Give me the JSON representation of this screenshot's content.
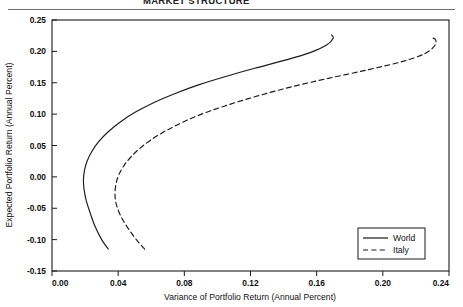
{
  "page": {
    "running_head": "MARKET STRUCTURE"
  },
  "chart_data": {
    "type": "line",
    "title": "",
    "xlabel": "Variance of Portfolio Return (Annual Percent)",
    "ylabel": "Expected Portfolio Return (Annual Percent)",
    "xlim": [
      0.0,
      0.24
    ],
    "ylim": [
      -0.15,
      0.25
    ],
    "xticks": [
      "0.00",
      "0.04",
      "0.08",
      "0.12",
      "0.16",
      "0.20",
      "0.24"
    ],
    "xtick_values": [
      0.0,
      0.04,
      0.08,
      0.12,
      0.16,
      0.2,
      0.24
    ],
    "yticks": [
      "0.25",
      "0.20",
      "0.15",
      "0.10",
      "0.05",
      "0.00",
      "-0.05",
      "-0.10",
      "-0.15"
    ],
    "ytick_values": [
      0.25,
      0.2,
      0.15,
      0.1,
      0.05,
      0.0,
      -0.05,
      -0.1,
      -0.15
    ],
    "grid": false,
    "legend_position": "bottom-right",
    "series": [
      {
        "name": "World",
        "style": "solid",
        "color": "#1a1a1a",
        "points": [
          [
            0.034,
            -0.115
          ],
          [
            0.03,
            -0.1
          ],
          [
            0.0262,
            -0.08
          ],
          [
            0.0234,
            -0.06
          ],
          [
            0.0207,
            -0.038
          ],
          [
            0.0194,
            -0.02
          ],
          [
            0.019,
            -0.005
          ],
          [
            0.0196,
            0.01
          ],
          [
            0.0212,
            0.025
          ],
          [
            0.024,
            0.04
          ],
          [
            0.0282,
            0.056
          ],
          [
            0.034,
            0.072
          ],
          [
            0.0415,
            0.088
          ],
          [
            0.051,
            0.104
          ],
          [
            0.062,
            0.119
          ],
          [
            0.0745,
            0.133
          ],
          [
            0.089,
            0.147
          ],
          [
            0.105,
            0.16
          ],
          [
            0.1225,
            0.173
          ],
          [
            0.141,
            0.186
          ],
          [
            0.156,
            0.198
          ],
          [
            0.166,
            0.21
          ],
          [
            0.17,
            0.221
          ],
          [
            0.169,
            0.226
          ]
        ]
      },
      {
        "name": "Italy",
        "style": "dashed",
        "color": "#1a1a1a",
        "points": [
          [
            0.056,
            -0.115
          ],
          [
            0.051,
            -0.1
          ],
          [
            0.0455,
            -0.08
          ],
          [
            0.0415,
            -0.062
          ],
          [
            0.039,
            -0.045
          ],
          [
            0.0381,
            -0.03
          ],
          [
            0.0385,
            -0.014
          ],
          [
            0.0402,
            0.002
          ],
          [
            0.0435,
            0.018
          ],
          [
            0.0485,
            0.034
          ],
          [
            0.0552,
            0.05
          ],
          [
            0.064,
            0.066
          ],
          [
            0.075,
            0.082
          ],
          [
            0.0885,
            0.098
          ],
          [
            0.1045,
            0.113
          ],
          [
            0.123,
            0.128
          ],
          [
            0.144,
            0.143
          ],
          [
            0.167,
            0.157
          ],
          [
            0.1915,
            0.171
          ],
          [
            0.212,
            0.184
          ],
          [
            0.225,
            0.196
          ],
          [
            0.231,
            0.208
          ],
          [
            0.232,
            0.218
          ],
          [
            0.229,
            0.2225
          ]
        ]
      }
    ]
  }
}
